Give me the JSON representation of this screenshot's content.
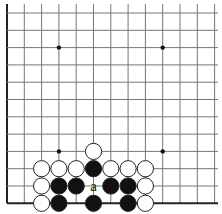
{
  "diagram": {
    "type": "go-board-fragment",
    "view": "lower-left corner",
    "columns": 13,
    "rows": 12,
    "grid": {
      "origin_x": 7,
      "origin_y": 13,
      "spacing": 17.3,
      "top_extend": 4,
      "right_extend": 218,
      "line_color": "#777777",
      "edge_color": "#222222"
    },
    "edges": [
      "left",
      "bottom"
    ],
    "star_points": [
      {
        "col": 3,
        "row": 2
      },
      {
        "col": 9,
        "row": 2
      },
      {
        "col": 3,
        "row": 8
      },
      {
        "col": 9,
        "row": 8
      }
    ],
    "stones": [
      {
        "color": "white",
        "col": 5,
        "row": 8
      },
      {
        "color": "white",
        "col": 2,
        "row": 9
      },
      {
        "color": "white",
        "col": 3,
        "row": 9
      },
      {
        "color": "white",
        "col": 4,
        "row": 9
      },
      {
        "color": "black",
        "col": 5,
        "row": 9
      },
      {
        "color": "white",
        "col": 6,
        "row": 9
      },
      {
        "color": "white",
        "col": 7,
        "row": 9
      },
      {
        "color": "white",
        "col": 8,
        "row": 9
      },
      {
        "color": "white",
        "col": 2,
        "row": 10
      },
      {
        "color": "black",
        "col": 3,
        "row": 10
      },
      {
        "color": "black",
        "col": 4,
        "row": 10
      },
      {
        "color": "black",
        "col": 6,
        "row": 10
      },
      {
        "color": "black",
        "col": 7,
        "row": 10
      },
      {
        "color": "white",
        "col": 8,
        "row": 10
      },
      {
        "color": "white",
        "col": 2,
        "row": 11
      },
      {
        "color": "black",
        "col": 3,
        "row": 11
      },
      {
        "color": "black",
        "col": 5,
        "row": 11
      },
      {
        "color": "black",
        "col": 7,
        "row": 11
      },
      {
        "color": "white",
        "col": 8,
        "row": 11
      }
    ],
    "labels": [
      {
        "text": "a",
        "col": 5,
        "row": 10
      }
    ],
    "colors": {
      "black_stone": "#111111",
      "white_stone": "#ffffff",
      "stone_outline": "#222222"
    }
  }
}
